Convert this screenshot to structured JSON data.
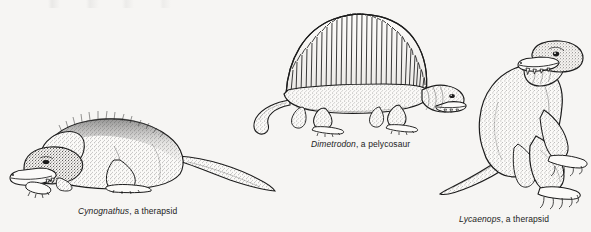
{
  "plate": {
    "background_color": "#f6f5f3",
    "ink_color": "#1c1c1c",
    "width": 591,
    "height": 232,
    "medium": "stippled pen-and-ink scientific illustration",
    "subject": "Permian synapsids"
  },
  "specimens": [
    {
      "id": "cynognathus",
      "genus": "Cynognathus",
      "description": ", a therapsid",
      "caption_full": "Cynognathus, a therapsid",
      "pose": "resting prone, head lowered on forelimbs, long tapering tail extending to the right",
      "features": [
        "bristly dorsal fur texture",
        "broad dog-like snout",
        "visible canine teeth",
        "five-toed splayed feet"
      ]
    },
    {
      "id": "dimetrodon",
      "genus": "Dimetrodon",
      "description": ", a pelycosaur",
      "caption_full": "Dimetrodon, a pelycosaur",
      "pose": "standing in lateral profile facing right, long tail curving down and to the left",
      "features": [
        "tall dorsal sail of elongated neural spines",
        "scalloped sail margin",
        "stippled lizard-like body",
        "clawed sprawling limbs"
      ],
      "sail_spine_count": 30
    },
    {
      "id": "lycaenops",
      "genus": "Lycaenops",
      "description": ", a therapsid",
      "caption_full": "Lycaenops, a therapsid",
      "pose": "upright rearing posture facing right, tail resting down and to the left",
      "features": [
        "wolf-like skull with large canine",
        "stippled hide",
        "heavy hind limbs",
        "clawed digits"
      ]
    }
  ],
  "icons": {
    "specimen_marker": "animal-silhouette-icon"
  }
}
